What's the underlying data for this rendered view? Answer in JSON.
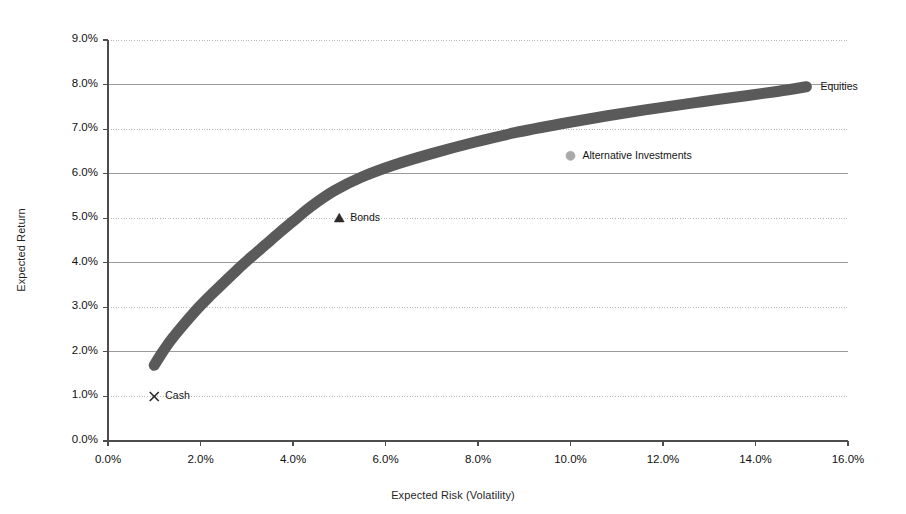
{
  "chart_data": {
    "type": "line",
    "title": "",
    "xlabel": "Expected Risk (Volatility)",
    "ylabel": "Expected Return",
    "xlim": [
      0,
      16
    ],
    "ylim": [
      0,
      9
    ],
    "xticks": [
      "0.0%",
      "2.0%",
      "4.0%",
      "6.0%",
      "8.0%",
      "10.0%",
      "12.0%",
      "14.0%",
      "16.0%"
    ],
    "xtick_values": [
      0,
      2,
      4,
      6,
      8,
      10,
      12,
      14,
      16
    ],
    "yticks": [
      "0.0%",
      "1.0%",
      "2.0%",
      "3.0%",
      "4.0%",
      "5.0%",
      "6.0%",
      "7.0%",
      "8.0%",
      "9.0%"
    ],
    "ytick_values": [
      0,
      1,
      2,
      3,
      4,
      5,
      6,
      7,
      8,
      9
    ],
    "grid": "horizontal",
    "legend_position": "inline-annotations",
    "series": [
      {
        "name": "Efficient Frontier",
        "type": "line",
        "color": "#5a5a5a",
        "line_width": 11,
        "x": [
          1.0,
          1.15,
          1.35,
          1.6,
          1.9,
          2.2,
          2.5,
          2.8,
          3.1,
          3.4,
          3.7,
          4.0,
          4.4,
          4.9,
          5.5,
          6.2,
          7.0,
          7.9,
          8.8,
          9.8,
          10.8,
          11.8,
          12.8,
          13.8,
          14.5,
          15.1
        ],
        "y": [
          1.7,
          1.95,
          2.25,
          2.57,
          2.93,
          3.25,
          3.55,
          3.85,
          4.13,
          4.4,
          4.67,
          4.93,
          5.27,
          5.62,
          5.93,
          6.2,
          6.45,
          6.7,
          6.92,
          7.12,
          7.3,
          7.46,
          7.61,
          7.75,
          7.85,
          7.95
        ],
        "annotation": "Equities",
        "annotation_point": [
          15.1,
          7.95
        ]
      }
    ],
    "points": [
      {
        "label": "Cash",
        "marker": "x-marker",
        "color": "#2b2b2b",
        "x": 1.0,
        "y": 1.0,
        "label_offset_px": [
          11,
          0
        ]
      },
      {
        "label": "Bonds",
        "marker": "triangle-marker",
        "color": "#2b2b2b",
        "x": 5.0,
        "y": 5.0,
        "label_offset_px": [
          11,
          0
        ]
      },
      {
        "label": "Alternative Investments",
        "marker": "circle-marker",
        "color": "#a9a9a9",
        "x": 10.0,
        "y": 6.4,
        "label_offset_px": [
          12,
          0
        ]
      }
    ],
    "annotations": [
      {
        "text": "Equities",
        "x": 15.1,
        "y": 7.95,
        "offset_px": [
          14,
          0
        ]
      }
    ],
    "colors": {
      "frontier": "#5a5a5a",
      "gridline_solid": "#9b9b9b",
      "gridline_dotted": "#b8b8b8",
      "axis": "#4d4d4d",
      "text": "#141414",
      "background": "#ffffff"
    },
    "plot_area_px": {
      "left": 108,
      "right": 848,
      "top": 40,
      "bottom": 441
    }
  }
}
